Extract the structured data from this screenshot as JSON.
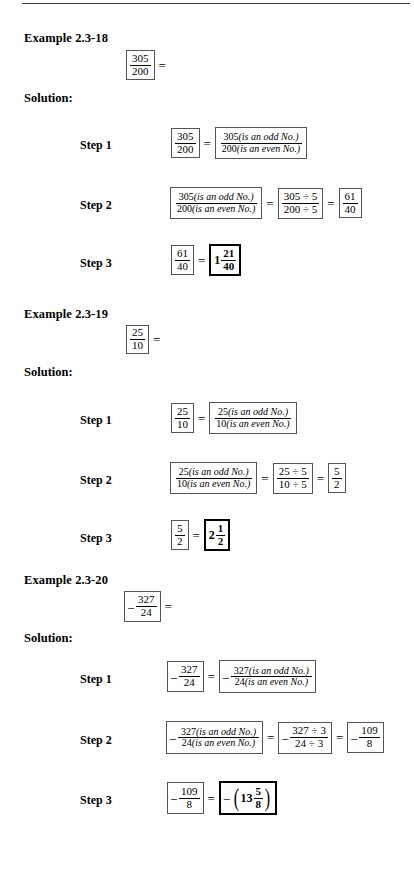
{
  "page": {
    "rule_present": true
  },
  "labels": {
    "solution": "Solution:",
    "step1": "Step 1",
    "step2": "Step 2",
    "step3": "Step 3",
    "equals": "=",
    "minus": "–",
    "odd_note": "(is an odd  No.)",
    "even_note": "(is an even  No.)",
    "paren_left": "(",
    "paren_right": ")"
  },
  "examples": [
    {
      "title": "Example 2.3-18",
      "problem": {
        "num": "305",
        "den": "200"
      },
      "step1": {
        "left": {
          "num": "305",
          "den": "200"
        },
        "right": {
          "num": "305",
          "den": "200"
        }
      },
      "step2": {
        "left": {
          "num": "305",
          "den": "200"
        },
        "middle": {
          "num": "305 ÷ 5",
          "den": "200 ÷ 5"
        },
        "right": {
          "num": "61",
          "den": "40"
        }
      },
      "step3": {
        "left": {
          "num": "61",
          "den": "40"
        },
        "answer": {
          "whole": "1",
          "num": "21",
          "den": "40"
        }
      }
    },
    {
      "title": "Example 2.3-19",
      "problem": {
        "num": "25",
        "den": "10"
      },
      "step1": {
        "left": {
          "num": "25",
          "den": "10"
        },
        "right": {
          "num": "25",
          "den": "10"
        }
      },
      "step2": {
        "left": {
          "num": "25",
          "den": "10"
        },
        "middle": {
          "num": "25 ÷ 5",
          "den": "10 ÷ 5"
        },
        "right": {
          "num": "5",
          "den": "2"
        }
      },
      "step3": {
        "left": {
          "num": "5",
          "den": "2"
        },
        "answer": {
          "whole": "2",
          "num": "1",
          "den": "2"
        }
      }
    },
    {
      "title": "Example 2.3-20",
      "problem": {
        "num": "327",
        "den": "24"
      },
      "step1": {
        "left": {
          "num": "327",
          "den": "24"
        },
        "right": {
          "num": "327",
          "den": "24"
        }
      },
      "step2": {
        "left": {
          "num": "327",
          "den": "24"
        },
        "middle": {
          "num": "327 ÷ 3",
          "den": "24 ÷ 3"
        },
        "right": {
          "num": "109",
          "den": "8"
        }
      },
      "step3": {
        "left": {
          "num": "109",
          "den": "8"
        },
        "answer": {
          "whole": "13",
          "num": "5",
          "den": "8"
        }
      }
    }
  ]
}
